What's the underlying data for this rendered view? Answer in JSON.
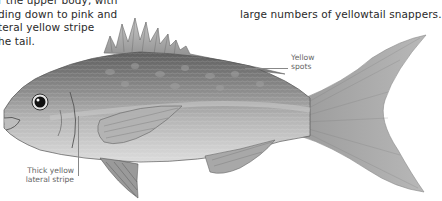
{
  "caption_left": {
    "lines": [
      "r the upper body, with",
      "ding down to pink and",
      "teral yellow stripe",
      "he tail."
    ]
  },
  "caption_right": {
    "lines": [
      "",
      "large numbers of yellowtail snappers."
    ]
  },
  "annotations": {
    "spots": {
      "lines": [
        "Yellow",
        "spots"
      ]
    },
    "stripe": {
      "lines": [
        "Thick yellow",
        "lateral stripe"
      ]
    }
  },
  "illustration": {
    "subject": "yellowtail-snapper-fish",
    "colors": {
      "body": "#9a9a9a",
      "back": "#6e6e6e",
      "belly": "#d4d4d4",
      "fin": "#a8a8a8",
      "eye": "#111111"
    }
  }
}
